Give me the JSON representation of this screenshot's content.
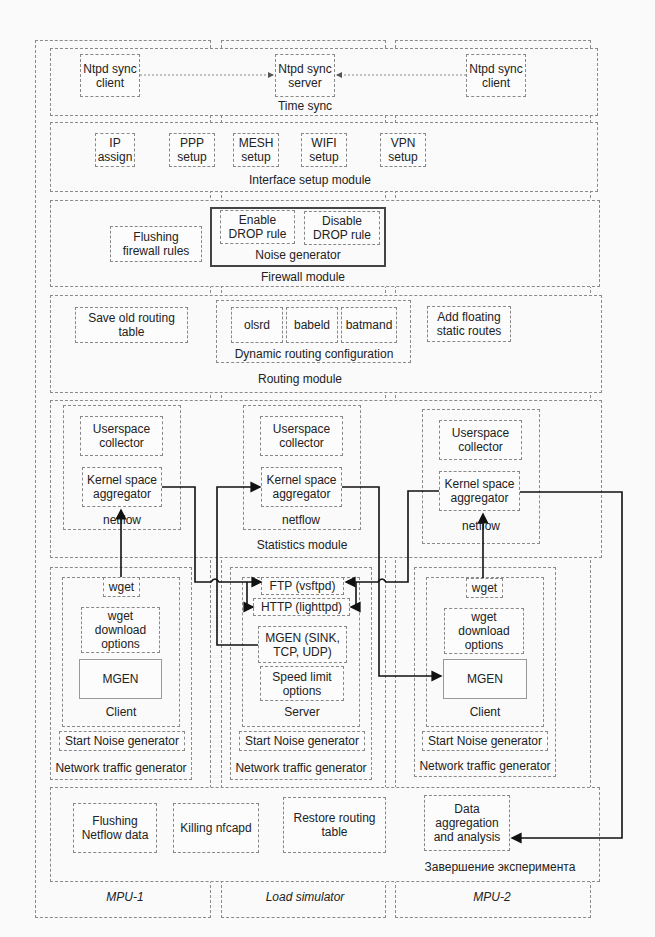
{
  "columns": [
    {
      "label": "MPU-1"
    },
    {
      "label": "Load simulator"
    },
    {
      "label": "MPU-2"
    }
  ],
  "time_sync": {
    "title": "Time sync",
    "client_left": "Ntpd sync\nclient",
    "server": "Ntpd sync\nserver",
    "client_right": "Ntpd sync\nclient"
  },
  "interface_setup": {
    "title": "Interface setup module",
    "items": [
      "IP\nassign",
      "PPP\nsetup",
      "MESH\nsetup",
      "WIFI\nsetup",
      "VPN\nsetup"
    ]
  },
  "firewall": {
    "title": "Firewall module",
    "flushing": "Flushing\nfirewall rules",
    "noise_generator": {
      "title": "Noise generator",
      "enable": "Enable\nDROP rule",
      "disable": "Disable\nDROP rule"
    }
  },
  "routing": {
    "title": "Routing module",
    "save_old": "Save old routing\ntable",
    "dynamic": {
      "title": "Dynamic routing configuration",
      "items": [
        "olsrd",
        "babeld",
        "batmand"
      ]
    },
    "add_floating": "Add floating\nstatic routes"
  },
  "statistics": {
    "title": "Statistics module",
    "netflow_label": "netflow",
    "userspace": "Userspace\ncollector",
    "kernel": "Kernel space\naggregator"
  },
  "traffic": {
    "title": "Network traffic generator",
    "start_noise": "Start Noise generator",
    "client": {
      "title": "Client",
      "wget": "wget",
      "wget_options": "wget\ndownload\noptions",
      "mgen": "MGEN"
    },
    "server": {
      "title": "Server",
      "ftp": "FTP (vsftpd)",
      "http": "HTTP (lighttpd)",
      "mgen": "MGEN (SINK,\nTCP, UDP)",
      "speed": "Speed limit\noptions"
    }
  },
  "finish": {
    "title": "Завершение эксперимента",
    "items": [
      "Flushing\nNetflow data",
      "Killing nfcapd",
      "Restore routing\ntable",
      "Data\naggregation\nand analysis"
    ]
  }
}
